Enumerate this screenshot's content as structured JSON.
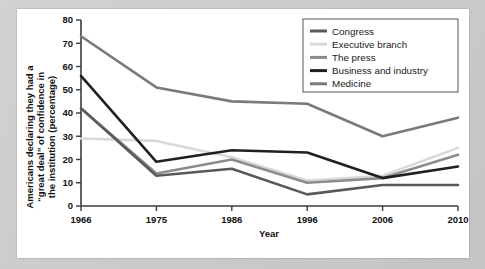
{
  "figure": {
    "panel_background": "#ffffff",
    "outer_background": "#cccccc"
  },
  "chart_data": {
    "type": "line",
    "title": "",
    "subtitle": "",
    "xlabel": "Year",
    "ylabel": "Americans declaring they had a “great deal” of confidence in the institution (percentage)",
    "ylabel_lines": [
      "Americans declaring they had a",
      "“great deal” of confidence in",
      "the institution (percentage)"
    ],
    "categories": [
      "1966",
      "1975",
      "1986",
      "1996",
      "2006",
      "2010"
    ],
    "x": [
      1966,
      1975,
      1986,
      1996,
      2006,
      2010
    ],
    "xlim": [
      0,
      5
    ],
    "ylim": [
      0,
      80
    ],
    "yticks": [
      0,
      10,
      20,
      30,
      40,
      50,
      60,
      70,
      80
    ],
    "ytick_labels": [
      "0",
      "10",
      "20",
      "30",
      "40",
      "50",
      "60",
      "70",
      "80"
    ],
    "grid": false,
    "legend_position": "top-right",
    "series": [
      {
        "name": "Congress",
        "color": "#59595b",
        "values": [
          42,
          13,
          16,
          5,
          9,
          9
        ]
      },
      {
        "name": "Executive branch",
        "color": "#d9d9d9",
        "values": [
          29,
          28,
          21,
          11,
          13,
          25
        ]
      },
      {
        "name": "The press",
        "color": "#8c8c8e",
        "values": [
          42,
          14,
          20,
          10,
          12,
          22
        ]
      },
      {
        "name": "Business and industry",
        "color": "#231f20",
        "values": [
          56,
          19,
          24,
          23,
          12,
          17
        ]
      },
      {
        "name": "Medicine",
        "color": "#7a7a7c",
        "values": [
          73,
          51,
          45,
          44,
          30,
          38
        ]
      }
    ]
  },
  "legend": {
    "items": [
      {
        "label": "Congress",
        "swatch_color": "#59595b"
      },
      {
        "label": "Executive branch",
        "swatch_color": "#d9d9d9"
      },
      {
        "label": "The press",
        "swatch_color": "#8c8c8e"
      },
      {
        "label": "Business and industry",
        "swatch_color": "#231f20"
      },
      {
        "label": "Medicine",
        "swatch_color": "#7a7a7c"
      }
    ],
    "border_color": "#555555"
  },
  "axes": {
    "x_axis_label": "Year",
    "x_tick_labels": [
      "1966",
      "1975",
      "1986",
      "1996",
      "2006",
      "2010"
    ],
    "y_tick_labels": [
      "0",
      "10",
      "20",
      "30",
      "40",
      "50",
      "60",
      "70",
      "80"
    ],
    "axis_color": "#3d3d3d"
  }
}
